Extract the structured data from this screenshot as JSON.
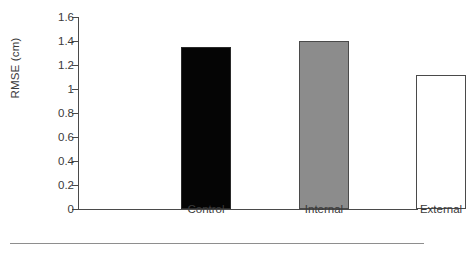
{
  "chart_data": {
    "type": "bar",
    "title": "",
    "subtitle": "",
    "xlabel": "",
    "ylabel": "RMSE (cm)",
    "categories": [
      "Control",
      "Internal",
      "External"
    ],
    "values": [
      1.35,
      1.4,
      1.12
    ],
    "series": [
      {
        "name": "RMSE",
        "values": [
          1.35,
          1.4,
          1.12
        ]
      }
    ],
    "bar_styles": [
      {
        "category": "Control",
        "fill": "#050505",
        "stroke": "#2a2a2a",
        "pattern": "solid-black"
      },
      {
        "category": "Internal",
        "fill": "#8c8c8c",
        "stroke": "#4a4a4a",
        "pattern": "solid-gray"
      },
      {
        "category": "External",
        "fill": "#ffffff",
        "stroke": "#4a4a4a",
        "pattern": "outline-white"
      }
    ],
    "ylim": [
      0,
      1.6
    ],
    "ytick_values": [
      0,
      0.2,
      0.4,
      0.6,
      0.8,
      1,
      1.2,
      1.4,
      1.6
    ],
    "ytick_labels": [
      "0",
      "0.2",
      "0.4",
      "0.6",
      "0.8",
      "1",
      "1.2",
      "1.4",
      "1.6"
    ],
    "grid": false,
    "legend": null,
    "legend_position": "none",
    "annotations": [],
    "axis_color": "#4a4a4a",
    "text_color": "#3a3a3a",
    "background": "#ffffff",
    "tick_direction": "out",
    "spines": [
      "left",
      "bottom"
    ]
  },
  "figure": {
    "footer_rule_color": "#8e8e8e"
  }
}
